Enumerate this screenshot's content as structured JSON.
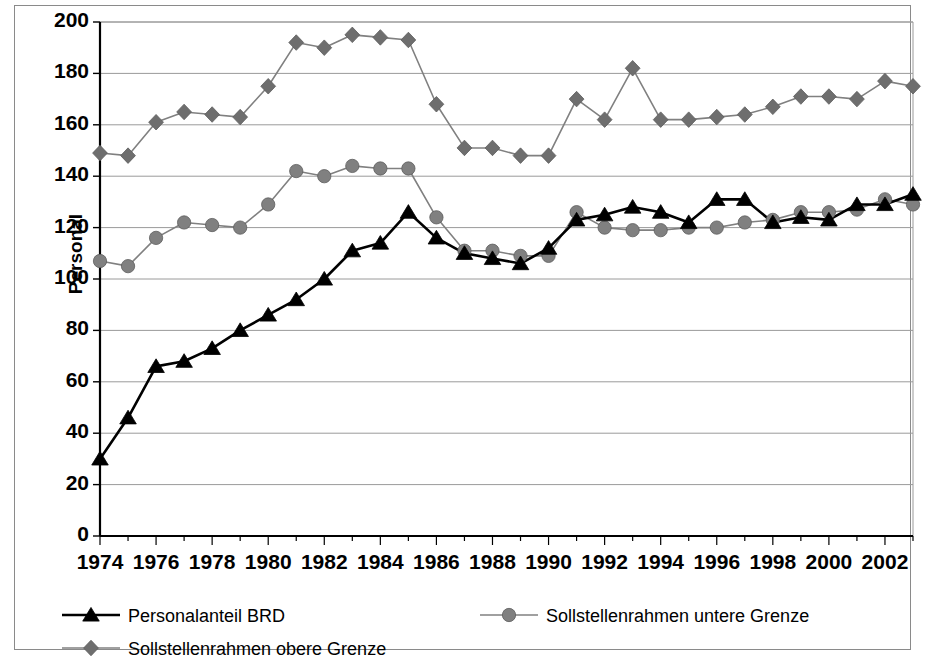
{
  "chart_data": {
    "type": "line",
    "title": "",
    "xlabel": "",
    "ylabel": "Personal",
    "ylim": [
      0,
      200
    ],
    "ytick_values": [
      0,
      20,
      40,
      60,
      80,
      100,
      120,
      140,
      160,
      180,
      200
    ],
    "ytick_labels": [
      "0",
      "20",
      "40",
      "60",
      "80",
      "100",
      "120",
      "140",
      "160",
      "180",
      "200"
    ],
    "xlim": [
      1974,
      2003
    ],
    "x": [
      1974,
      1975,
      1976,
      1977,
      1978,
      1979,
      1980,
      1981,
      1982,
      1983,
      1984,
      1985,
      1986,
      1987,
      1988,
      1989,
      1990,
      1991,
      1992,
      1993,
      1994,
      1995,
      1996,
      1997,
      1998,
      1999,
      2000,
      2001,
      2002,
      2003
    ],
    "xtick_values": [
      1974,
      1976,
      1978,
      1980,
      1982,
      1984,
      1986,
      1988,
      1990,
      1992,
      1994,
      1996,
      1998,
      2000,
      2002
    ],
    "xtick_labels": [
      "1974",
      "1976",
      "1978",
      "1980",
      "1982",
      "1984",
      "1986",
      "1988",
      "1990",
      "1992",
      "1994",
      "1996",
      "1998",
      "2000",
      "2002"
    ],
    "grid": true,
    "grid_axis": "y",
    "legend_position": "bottom",
    "series": [
      {
        "name": "Personalanteil BRD",
        "marker": "triangle",
        "color": "#000000",
        "line_color": "#000000",
        "values": [
          30,
          46,
          66,
          68,
          73,
          80,
          86,
          92,
          100,
          111,
          114,
          126,
          116,
          110,
          108,
          106,
          112,
          123,
          125,
          128,
          126,
          122,
          131,
          131,
          122,
          124,
          123,
          129,
          129,
          133
        ]
      },
      {
        "name": "Sollstellenrahmen untere Grenze",
        "marker": "circle",
        "color": "#808080",
        "line_color": "#808080",
        "values": [
          107,
          105,
          116,
          122,
          121,
          120,
          129,
          142,
          140,
          144,
          143,
          143,
          124,
          111,
          111,
          109,
          109,
          126,
          120,
          119,
          119,
          120,
          120,
          122,
          123,
          126,
          126,
          127,
          131,
          129
        ]
      },
      {
        "name": "Sollstellenrahmen obere Grenze",
        "marker": "diamond",
        "color": "#6e6e6e",
        "line_color": "#808080",
        "values": [
          149,
          148,
          161,
          165,
          164,
          163,
          175,
          192,
          190,
          195,
          194,
          193,
          168,
          151,
          151,
          148,
          148,
          170,
          162,
          182,
          162,
          162,
          163,
          164,
          167,
          171,
          171,
          170,
          177,
          175
        ]
      }
    ]
  },
  "axis": {
    "ylabel": "Personal"
  }
}
